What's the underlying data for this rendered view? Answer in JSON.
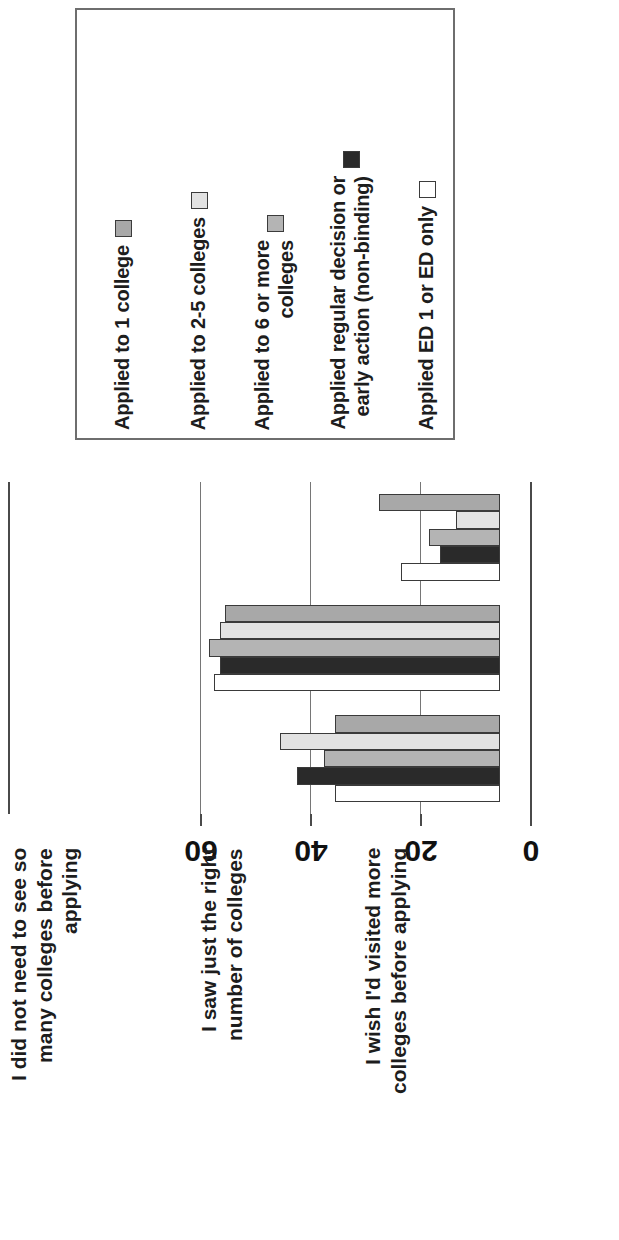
{
  "chart_data": {
    "type": "bar",
    "orientation": "rotated-90",
    "title": "",
    "xlabel": "",
    "ylabel": "",
    "axis_ticks": [
      "0",
      "20",
      "40",
      "60"
    ],
    "ylim": [
      0,
      60
    ],
    "grid": true,
    "legend_position": "top",
    "categories": [
      "I did not need to see so\nmany colleges before\napplying",
      "I saw just the right\nnumber of colleges",
      "I wish I'd visited more\ncolleges before applying"
    ],
    "series": [
      {
        "name": "Applied to 1 college",
        "color": "#a8a8a8",
        "values": [
          22,
          50,
          30
        ]
      },
      {
        "name": "Applied to 2-5 colleges",
        "color": "#e2e2e2",
        "values": [
          8,
          51,
          40
        ]
      },
      {
        "name": "Applied to 6 or more\ncolleges",
        "color": "#b4b4b4",
        "values": [
          13,
          53,
          32
        ]
      },
      {
        "name": "Applied regular decision or\nearly action (non-binding)",
        "color": "#2a2a2a",
        "values": [
          11,
          51,
          37
        ]
      },
      {
        "name": "Applied ED 1 or ED only",
        "color": "#ffffff",
        "values": [
          18,
          52,
          30
        ]
      }
    ]
  },
  "legend": {
    "items": [
      {
        "label": "Applied to 1 college",
        "color": "#a8a8a8"
      },
      {
        "label": "Applied to 2-5 colleges",
        "color": "#e2e2e2"
      },
      {
        "label": "Applied to 6 or more\ncolleges",
        "color": "#b4b4b4"
      },
      {
        "label": "Applied regular decision or\nearly action (non-binding)",
        "color": "#2a2a2a"
      },
      {
        "label": "Applied ED 1 or ED only",
        "color": "#ffffff"
      }
    ]
  }
}
